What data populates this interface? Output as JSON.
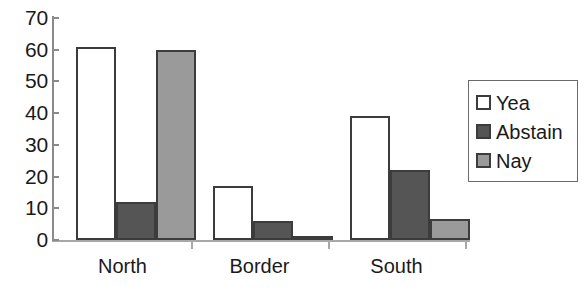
{
  "chart_data": {
    "type": "bar",
    "title": "",
    "subtitle": "",
    "xlabel": "",
    "ylabel": "",
    "categories": [
      "North",
      "Border",
      "South"
    ],
    "series": [
      {
        "name": "Yea",
        "color": "#ffffff",
        "values": [
          61,
          17,
          39
        ]
      },
      {
        "name": "Abstain",
        "color": "#555555",
        "values": [
          12,
          6,
          22
        ]
      },
      {
        "name": "Nay",
        "color": "#9a9a9a",
        "values": [
          60,
          1,
          6.5
        ]
      }
    ],
    "ylim": [
      0,
      70
    ],
    "yticks": [
      0,
      10,
      20,
      30,
      40,
      50,
      60,
      70
    ],
    "ytick_labels": [
      "0",
      "10",
      "20",
      "30",
      "40",
      "50",
      "60",
      "70"
    ],
    "grid": false,
    "legend_position": "right",
    "bar_border_color": "#3c3c3c",
    "axis_color": "#8a8a8a"
  },
  "legend": {
    "entries": [
      {
        "label": "Yea"
      },
      {
        "label": "Abstain"
      },
      {
        "label": "Nay"
      }
    ]
  }
}
